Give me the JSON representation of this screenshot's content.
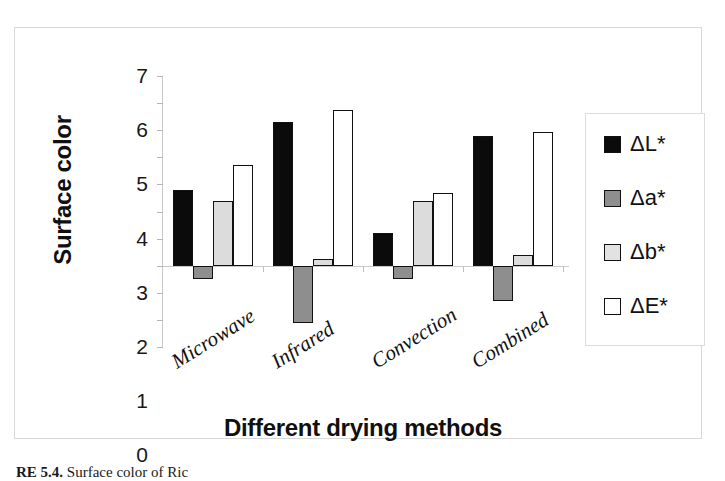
{
  "chart_data": {
    "type": "bar",
    "title": "",
    "xlabel": "Different drying methods",
    "ylabel": "Surface color",
    "categories": [
      "Microwave",
      "Infrared",
      "Convection",
      "Combined"
    ],
    "series": [
      {
        "name": "ΔL*",
        "color": "#0b0b0b",
        "values": [
          2.8,
          5.3,
          1.2,
          4.8
        ]
      },
      {
        "name": "Δa*",
        "color": "#8e8e8e",
        "values": [
          -0.5,
          -2.1,
          -0.5,
          -1.3
        ]
      },
      {
        "name": "Δb*",
        "color": "#dcdcdc",
        "values": [
          2.4,
          0.25,
          2.4,
          0.4
        ]
      },
      {
        "name": "ΔE*",
        "color": "#ffffff",
        "values": [
          3.7,
          5.75,
          2.7,
          4.95
        ]
      }
    ],
    "ylim": [
      -3,
      7
    ],
    "yticks": [
      7,
      6,
      5,
      4,
      3,
      2,
      1,
      0,
      -1,
      -2,
      -3
    ],
    "ytick_labels": [
      "7",
      "6",
      "5",
      "4",
      "3",
      "2",
      "1",
      "0",
      "-1",
      "-2",
      "-3"
    ],
    "grid": false,
    "legend_position": "right",
    "legend_entries": [
      "ΔL*",
      "Δa*",
      "Δb*",
      "ΔE*"
    ]
  },
  "caption": {
    "number": "RE 5.4.",
    "text": "Surface color of Ric"
  }
}
